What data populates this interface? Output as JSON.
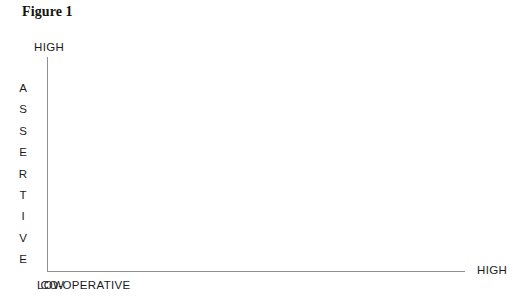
{
  "figure": {
    "title": "Figure 1"
  },
  "chart_data": {
    "type": "scatter",
    "title": "Figure 1",
    "xlabel": "CO-OPERATIVE",
    "ylabel": "ASSERTIVE",
    "x_tick_labels": [
      "LOW",
      "HIGH"
    ],
    "y_tick_labels": [
      "HIGH"
    ],
    "x": [],
    "y": [],
    "series": [],
    "annotations": [],
    "grid": false,
    "legend": false,
    "note": "Empty two-axis grid: vertical axis ASSERTIVE (HIGH at top), horizontal axis CO-OPERATIVE (LOW at left, HIGH at right). No data points plotted."
  },
  "axes": {
    "y": {
      "title": "ASSERTIVE",
      "title_letters": [
        "A",
        "S",
        "S",
        "E",
        "R",
        "T",
        "I",
        "V",
        "E"
      ],
      "high_label": "HIGH"
    },
    "x": {
      "title": "CO-OPERATIVE",
      "low_label": "LOW",
      "high_label": "HIGH"
    }
  },
  "colors": {
    "background": "#ffffff",
    "axis_line": "#8e9094",
    "text": "#1b1b1b",
    "title_text": "#15130f"
  }
}
